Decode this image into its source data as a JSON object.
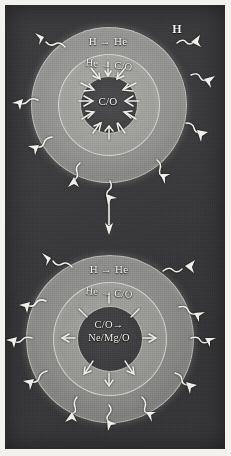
{
  "figure": {
    "panels": [
      {
        "id": "top",
        "name": "pre-supernova-shell-burning-stage-1",
        "shell_outer_label": "H → He",
        "shell_mid_label": "He → C/O",
        "core_label": "C/O",
        "external_label": "H",
        "core_flow": "inward",
        "wavy_arrow_count": 10
      },
      {
        "id": "bottom",
        "name": "pre-supernova-shell-burning-stage-2",
        "shell_outer_label": "H → He",
        "shell_mid_label": "He → C/O",
        "core_label_line1": "C/O→",
        "core_label_line2": "Ne/Mg/O",
        "core_flow": "outward",
        "wavy_arrow_count": 12
      }
    ],
    "transition_arrow": {
      "name": "evolution-arrow",
      "direction": "down",
      "label": ""
    },
    "colors": {
      "background": "#3a3a3c",
      "outer_shell": "#8e8e8c",
      "mid_shell": "#9b9b98",
      "core": "#414143",
      "ink": "#f2f1ec",
      "page": "#f4f2ee"
    }
  }
}
